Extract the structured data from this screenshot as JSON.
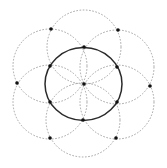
{
  "diagram": {
    "colors": {
      "main_circle": "#2a2a2a",
      "petal_circles": "#9a9a9a",
      "points": "#111111",
      "background": "#ffffff"
    },
    "main_circle": {
      "cx": 83.5,
      "cy": 84,
      "rx": 38.5,
      "ry": 36.5,
      "style": "solid"
    },
    "center_point": {
      "x": 84,
      "y": 84
    },
    "petal_circles": [
      {
        "cx": 84,
        "cy": 47,
        "r": 37,
        "style": "dashed"
      },
      {
        "cx": 117,
        "cy": 67,
        "r": 37,
        "style": "dashed"
      },
      {
        "cx": 117,
        "cy": 102,
        "r": 37,
        "style": "dashed"
      },
      {
        "cx": 83,
        "cy": 120,
        "r": 37,
        "style": "dashed"
      },
      {
        "cx": 50,
        "cy": 102,
        "r": 37,
        "style": "dashed"
      },
      {
        "cx": 50,
        "cy": 66,
        "r": 37,
        "style": "dashed"
      }
    ],
    "inner_points": [
      {
        "x": 84,
        "y": 47
      },
      {
        "x": 117,
        "y": 67
      },
      {
        "x": 117,
        "y": 102
      },
      {
        "x": 83,
        "y": 120
      },
      {
        "x": 50,
        "y": 102
      },
      {
        "x": 50,
        "y": 66
      }
    ],
    "outer_points": [
      {
        "x": 51,
        "y": 29
      },
      {
        "x": 118,
        "y": 30
      },
      {
        "x": 150,
        "y": 86
      },
      {
        "x": 116,
        "y": 138
      },
      {
        "x": 50,
        "y": 138
      },
      {
        "x": 17,
        "y": 83
      }
    ]
  }
}
